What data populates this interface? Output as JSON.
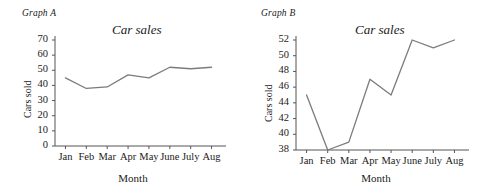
{
  "chart_data": [
    {
      "type": "line",
      "panel_label": "Graph A",
      "title": "Car sales",
      "xlabel": "Month",
      "ylabel": "Cars sold",
      "categories": [
        "Jan",
        "Feb",
        "Mar",
        "Apr",
        "May",
        "June",
        "July",
        "Aug"
      ],
      "values": [
        45,
        38,
        39,
        47,
        45,
        52,
        51,
        52
      ],
      "yticks": [
        0,
        10,
        20,
        30,
        40,
        50,
        60,
        70
      ],
      "ylim": [
        0,
        70
      ],
      "grid": false,
      "legend": "none",
      "line_color": "#7b7b7b",
      "axis_color": "#555555"
    },
    {
      "type": "line",
      "panel_label": "Graph B",
      "title": "Car sales",
      "xlabel": "Month",
      "ylabel": "Cars sold",
      "categories": [
        "Jan",
        "Feb",
        "Mar",
        "Apr",
        "May",
        "June",
        "July",
        "Aug"
      ],
      "values": [
        45,
        38,
        39,
        47,
        45,
        52,
        51,
        52
      ],
      "yticks": [
        38,
        40,
        42,
        44,
        46,
        48,
        50,
        52
      ],
      "ylim": [
        38,
        52
      ],
      "grid": false,
      "legend": "none",
      "line_color": "#7b7b7b",
      "axis_color": "#555555"
    }
  ]
}
